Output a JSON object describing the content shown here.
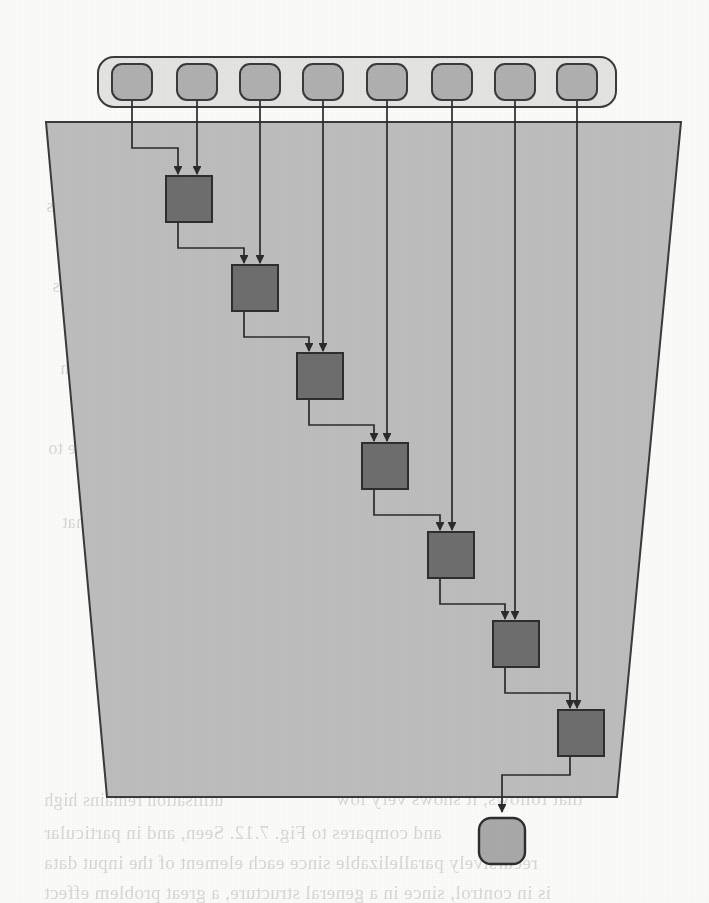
{
  "figure": {
    "canvas": {
      "width": 709,
      "height": 903
    },
    "colors": {
      "page_background": "#fbfbfa",
      "array_fill": "#bdbdbd",
      "array_stroke": "#3a3a3a",
      "input_bar_fill": "#e4e4e2",
      "input_cell_fill": "#b0b0b0",
      "input_cell_stroke": "#3a3a3a",
      "stage_fill": "#6e6e6e",
      "stage_stroke": "#2e2e2e",
      "output_fill": "#a9a9a9",
      "output_stroke": "#2e2e2e",
      "wire": "#2b2b2b",
      "bleed_text": "#bdbab5"
    },
    "geometry": {
      "input_bar": {
        "x": 98,
        "y": 57,
        "width": 518,
        "height": 50,
        "corner_radius": 16,
        "stroke_width": 2
      },
      "input_cells": {
        "count": 8,
        "width": 40,
        "height": 36,
        "corner_radius": 10,
        "y": 64,
        "x_positions": [
          112,
          177,
          240,
          303,
          367,
          432,
          495,
          557
        ],
        "wire_x": [
          132,
          197,
          260,
          323,
          387,
          452,
          515,
          577
        ]
      },
      "array_body": {
        "top_left_x": 46,
        "top_right_x": 681,
        "bottom_left_x": 107,
        "bottom_right_x": 617,
        "top_y": 122,
        "bottom_y": 797,
        "stroke_width": 2
      },
      "stages": {
        "count": 7,
        "width": 46,
        "height": 46,
        "x_positions": [
          166,
          232,
          297,
          362,
          428,
          493,
          558
        ],
        "y_positions": [
          176,
          265,
          353,
          443,
          532,
          621,
          710
        ]
      },
      "output_node": {
        "x": 479,
        "y": 818,
        "width": 46,
        "height": 46,
        "corner_radius": 12
      },
      "output_wire": {
        "exit_y": 775,
        "drop_x": 502,
        "arrow_y": 812
      }
    },
    "input_cells_labels": [
      "in-cell-1",
      "in-cell-2",
      "in-cell-3",
      "in-cell-4",
      "in-cell-5",
      "in-cell-6",
      "in-cell-7",
      "in-cell-8"
    ],
    "stage_labels": [
      "stage-1",
      "stage-2",
      "stage-3",
      "stage-4",
      "stage-5",
      "stage-6",
      "stage-7"
    ],
    "output_label": "output-node"
  },
  "bleed_text": [
    {
      "text": "of the processing element",
      "x": 372,
      "y": 160,
      "size": 18
    },
    {
      "text": "described in the previous",
      "x": 46,
      "y": 196,
      "size": 18
    },
    {
      "text": "communication between the",
      "x": 388,
      "y": 236,
      "size": 18
    },
    {
      "text": "two adjacent cells",
      "x": 52,
      "y": 276,
      "size": 18
    },
    {
      "text": "the systolic array architecture",
      "x": 352,
      "y": 318,
      "size": 18
    },
    {
      "text": "data flows through",
      "x": 60,
      "y": 358,
      "size": 18
    },
    {
      "text": "each clock cycle the partial",
      "x": 372,
      "y": 398,
      "size": 18
    },
    {
      "text": "results propagate to",
      "x": 48,
      "y": 438,
      "size": 18
    },
    {
      "text": "the neighbouring stage of the",
      "x": 358,
      "y": 474,
      "size": 18
    },
    {
      "text": "pipeline so that",
      "x": 62,
      "y": 512,
      "size": 18
    },
    {
      "text": "throughput is maximised",
      "x": 382,
      "y": 550,
      "size": 18
    },
    {
      "text": "utilisation remains high",
      "x": 44,
      "y": 790,
      "size": 18
    },
    {
      "text": "that follows, it shows very low",
      "x": 336,
      "y": 788,
      "size": 19
    },
    {
      "text": "and compares to Fig. 7.12. Seen, and in particular",
      "x": 44,
      "y": 822,
      "size": 19
    },
    {
      "text": "recursively parallelizable since each element of the input data",
      "x": 44,
      "y": 852,
      "size": 19
    },
    {
      "text": "is in control, since in a general structure, a great problem effect",
      "x": 44,
      "y": 882,
      "size": 19
    }
  ]
}
